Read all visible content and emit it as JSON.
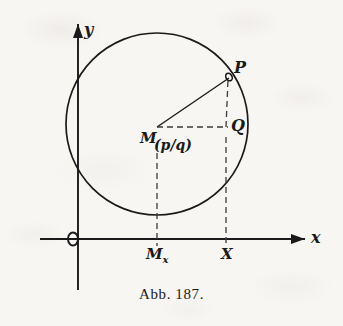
{
  "figure": {
    "caption": "Abb. 187.",
    "axes": {
      "x_label": "x",
      "y_label": "y",
      "origin_label": "O"
    },
    "points": [
      {
        "id": "P",
        "label": "P",
        "x": 228,
        "y": 77
      },
      {
        "id": "Q",
        "label": "Q",
        "x": 226,
        "y": 127
      },
      {
        "id": "M",
        "label": "M",
        "coords_label": "(p/q)",
        "x": 157,
        "y": 127
      }
    ],
    "tick_labels": [
      {
        "id": "Mx",
        "label": "M",
        "subscript": "x",
        "x": 157
      },
      {
        "id": "X",
        "label": "X",
        "subscript": "",
        "x": 226
      }
    ],
    "circle": {
      "cx": 157,
      "cy": 124,
      "r": 91
    },
    "colors": {
      "ink": "#1a1a1a",
      "paper": "#f8f6f3"
    }
  }
}
